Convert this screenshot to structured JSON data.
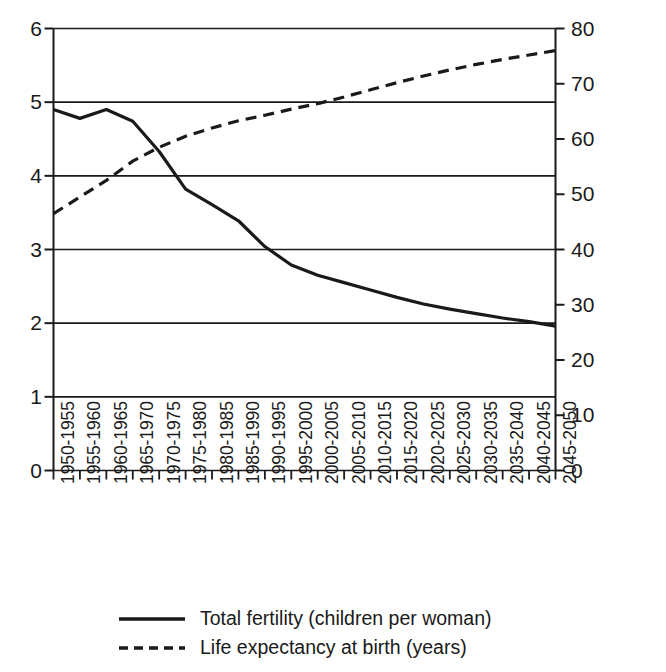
{
  "chart_data": {
    "type": "line",
    "title": "",
    "subtitle": "",
    "xlabel": "",
    "ylabel": "",
    "grid": true,
    "legend_position": "bottom",
    "categories": [
      "1950-1955",
      "1955-1960",
      "1960-1965",
      "1965-1970",
      "1970-1975",
      "1975-1980",
      "1980-1985",
      "1985-1990",
      "1990-1995",
      "1995-2000",
      "2000-2005",
      "2005-2010",
      "2010-2015",
      "2015-2020",
      "2020-2025",
      "2025-2030",
      "2030-2035",
      "2035-2040",
      "2040-2045",
      "2045-2050"
    ],
    "axes": {
      "left": {
        "label": "Total fertility (children per woman)",
        "ylim": [
          0,
          6
        ],
        "ticks": [
          0,
          1,
          2,
          3,
          4,
          5,
          6
        ],
        "tick_labels": [
          "0",
          "1",
          "2",
          "3",
          "4",
          "5",
          "6"
        ]
      },
      "right": {
        "label": "Life expectancy at birth (years)",
        "ylim": [
          0,
          80
        ],
        "ticks": [
          0,
          10,
          20,
          30,
          40,
          50,
          60,
          70,
          80
        ],
        "tick_labels": [
          "0",
          "10",
          "20",
          "30",
          "40",
          "50",
          "60",
          "70",
          "80"
        ]
      }
    },
    "series": [
      {
        "name": "Total fertility (children per woman)",
        "axis": "left",
        "style": "solid",
        "color": "#1a1a1a",
        "values": [
          4.9,
          4.78,
          4.9,
          4.74,
          4.33,
          3.82,
          3.61,
          3.39,
          3.04,
          2.79,
          2.65,
          2.55,
          2.45,
          2.35,
          2.26,
          2.19,
          2.13,
          2.07,
          2.02,
          1.96
        ]
      },
      {
        "name": "Life expectancy at birth (years)",
        "axis": "right",
        "style": "dashed",
        "color": "#1a1a1a",
        "values": [
          46.5,
          49.5,
          52.5,
          56.0,
          58.5,
          60.5,
          62.0,
          63.3,
          64.3,
          65.4,
          66.4,
          67.6,
          68.9,
          70.2,
          71.4,
          72.5,
          73.5,
          74.4,
          75.2,
          76.0
        ]
      }
    ],
    "legend": [
      {
        "swatch": "solid-line-swatch",
        "label": "Total fertility (children per woman)"
      },
      {
        "swatch": "dashed-line-swatch",
        "label": "Life expectancy at birth (years)"
      }
    ]
  }
}
